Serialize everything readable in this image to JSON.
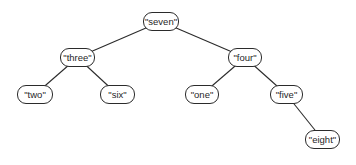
{
  "diagram": {
    "type": "binary-tree",
    "nodes": [
      {
        "id": "seven",
        "label": "\"seven\"",
        "x": 143,
        "y": 12,
        "w": 36
      },
      {
        "id": "three",
        "label": "\"three\"",
        "x": 60,
        "y": 48,
        "w": 35
      },
      {
        "id": "four",
        "label": "\"four\"",
        "x": 228,
        "y": 48,
        "w": 34
      },
      {
        "id": "two",
        "label": "\"two\"",
        "x": 17,
        "y": 85,
        "w": 36
      },
      {
        "id": "six",
        "label": "\"six\"",
        "x": 100,
        "y": 85,
        "w": 35
      },
      {
        "id": "one",
        "label": "\"one\"",
        "x": 185,
        "y": 85,
        "w": 34
      },
      {
        "id": "five",
        "label": "\"five\"",
        "x": 270,
        "y": 85,
        "w": 33
      },
      {
        "id": "eight",
        "label": "\"eight\"",
        "x": 305,
        "y": 130,
        "w": 35
      }
    ],
    "edges": [
      {
        "from": "seven",
        "to": "three"
      },
      {
        "from": "seven",
        "to": "four"
      },
      {
        "from": "three",
        "to": "two"
      },
      {
        "from": "three",
        "to": "six"
      },
      {
        "from": "four",
        "to": "one"
      },
      {
        "from": "four",
        "to": "five"
      },
      {
        "from": "five",
        "to": "eight"
      }
    ]
  }
}
